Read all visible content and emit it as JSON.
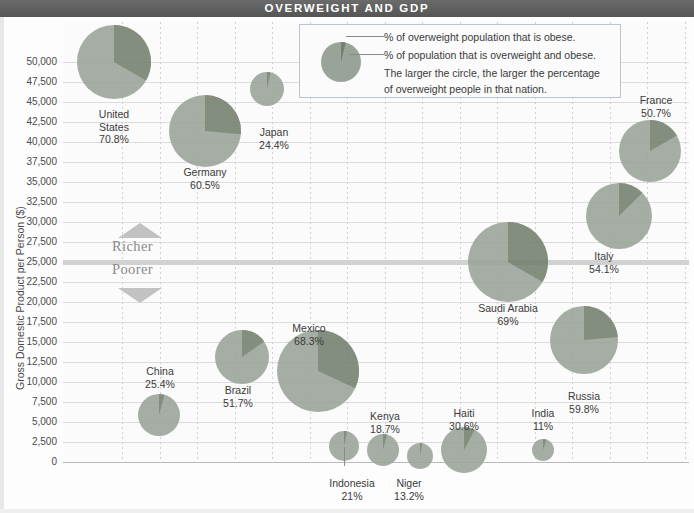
{
  "title": "OVERWEIGHT AND GDP",
  "axis": {
    "ylabel": "Gross Domestic Product per Person ($)",
    "yticks": [
      "50,000",
      "47,500",
      "45,000",
      "42,500",
      "40,000",
      "37,500",
      "35,000",
      "32,500",
      "30,000",
      "27,500",
      "25,000",
      "22,500",
      "20,000",
      "17,500",
      "15,000",
      "12,500",
      "10,000",
      "7,500",
      "5,000",
      "2,500",
      "0"
    ]
  },
  "legend": {
    "line1": "% of overweight population that is obese.",
    "line2": "% of population that is overweight and obese.",
    "line3": "The larger the circle, the larger the percentage",
    "line4": "of overweight people in that nation."
  },
  "scale": {
    "richer": "Richer",
    "poorer": "Poorer"
  },
  "colors": {
    "title_bar": "#5a5a5a",
    "bubble_light": "#9aa39a",
    "bubble_dark": "#74806f",
    "grid": "#dcdcdc",
    "band": "#c9c9c9"
  },
  "chart_data": {
    "type": "scatter",
    "title": "OVERWEIGHT AND GDP",
    "xlabel": "",
    "ylabel": "Gross Domestic Product per Person ($)",
    "ylim": [
      0,
      50000
    ],
    "grid": true,
    "legend_position": "top-center",
    "bubble_meaning": "circle area = % of population overweight and obese; dark wedge = % of overweight population that is obese",
    "points": [
      {
        "country": "United States",
        "overweight_pct": 70.8,
        "gdp": 48500,
        "obese_wedge_deg": 120
      },
      {
        "country": "Germany",
        "overweight_pct": 60.5,
        "gdp": 41500,
        "obese_wedge_deg": 95
      },
      {
        "country": "Japan",
        "overweight_pct": 24.4,
        "gdp": 45800,
        "obese_wedge_deg": 12
      },
      {
        "country": "France",
        "overweight_pct": 50.7,
        "gdp": 38800,
        "obese_wedge_deg": 60
      },
      {
        "country": "Italy",
        "overweight_pct": 54.1,
        "gdp": 31500,
        "obese_wedge_deg": 45
      },
      {
        "country": "Saudi Arabia",
        "overweight_pct": 69.0,
        "gdp": 25000,
        "obese_wedge_deg": 120
      },
      {
        "country": "Russia",
        "overweight_pct": 59.8,
        "gdp": 14500,
        "obese_wedge_deg": 85
      },
      {
        "country": "Mexico",
        "overweight_pct": 68.3,
        "gdp": 10000,
        "obese_wedge_deg": 115
      },
      {
        "country": "Brazil",
        "overweight_pct": 51.7,
        "gdp": 11500,
        "obese_wedge_deg": 55
      },
      {
        "country": "China",
        "overweight_pct": 25.4,
        "gdp": 7500,
        "obese_wedge_deg": 15
      },
      {
        "country": "Kenya",
        "overweight_pct": 18.7,
        "gdp": 2000,
        "obese_wedge_deg": 14
      },
      {
        "country": "Indonesia",
        "overweight_pct": 21.0,
        "gdp": 3000,
        "obese_wedge_deg": 12
      },
      {
        "country": "Niger",
        "overweight_pct": 13.2,
        "gdp": 1200,
        "obese_wedge_deg": 10
      },
      {
        "country": "Haiti",
        "overweight_pct": 30.6,
        "gdp": 1800,
        "obese_wedge_deg": 28
      },
      {
        "country": "India",
        "overweight_pct": 11.0,
        "gdp": 1500,
        "obese_wedge_deg": 18
      }
    ]
  },
  "labels": {
    "united_states": {
      "name": "United",
      "name2": "States",
      "value": "70.8%"
    },
    "germany": {
      "name": "Germany",
      "value": "60.5%"
    },
    "japan": {
      "name": "Japan",
      "value": "24.4%"
    },
    "france": {
      "name": "France",
      "value": "50.7%"
    },
    "italy": {
      "name": "Italy",
      "value": "54.1%"
    },
    "saudi": {
      "name": "Saudi Arabia",
      "value": "69%"
    },
    "russia": {
      "name": "Russia",
      "value": "59.8%"
    },
    "mexico": {
      "name": "Mexico",
      "value": "68.3%"
    },
    "brazil": {
      "name": "Brazil",
      "value": "51.7%"
    },
    "china": {
      "name": "China",
      "value": "25.4%"
    },
    "kenya": {
      "name": "Kenya",
      "value": "18.7%"
    },
    "indonesia": {
      "name": "Indonesia",
      "value": "21%"
    },
    "niger": {
      "name": "Niger",
      "value": "13.2%"
    },
    "haiti": {
      "name": "Haiti",
      "value": "30.6%"
    },
    "india": {
      "name": "India",
      "value": "11%"
    }
  }
}
